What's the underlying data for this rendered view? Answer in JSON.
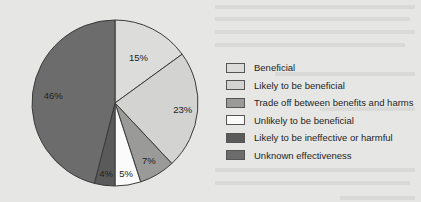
{
  "chart_data": {
    "type": "pie",
    "title": "",
    "categories": [
      "Beneficial",
      "Likely to be beneficial",
      "Trade off between benefits and harms",
      "Unlikely to be beneficial",
      "Likely to be ineffective or harmful",
      "Unknown effectiveness"
    ],
    "values": [
      15,
      23,
      7,
      5,
      4,
      46
    ],
    "value_labels": [
      "15%",
      "23%",
      "7%",
      "5%",
      "4%",
      "46%"
    ],
    "units": "%",
    "start_angle_deg": 0,
    "direction": "clockwise",
    "legend_position": "right",
    "mapping_note": "Slice values were read directly from the pie. The assignment of each value to a category is inferred from swatch shade and legend order, not read from labels: 15%/23% (both light) and 4%/46% (both dark) cannot be told apart by shade alone, so these pairings may be swapped.",
    "colors": [
      "#dcdcda",
      "#d3d3d1",
      "#9a9a98",
      "#fbfbfb",
      "#5a5a5a",
      "#6c6c6c"
    ]
  },
  "legend": {
    "items": [
      {
        "label": "Beneficial",
        "color": "#dcdcda"
      },
      {
        "label": "Likely to be beneficial",
        "color": "#d3d3d1"
      },
      {
        "label": "Trade off between benefits and harms",
        "color": "#9a9a98"
      },
      {
        "label": "Unlikely to be beneficial",
        "color": "#fbfbfb"
      },
      {
        "label": "Likely to be ineffective or harmful",
        "color": "#5a5a5a"
      },
      {
        "label": "Unknown effectiveness",
        "color": "#6c6c6c"
      }
    ]
  },
  "slices": [
    {
      "label": "15%"
    },
    {
      "label": "23%"
    },
    {
      "label": "7%"
    },
    {
      "label": "5%"
    },
    {
      "label": "4%"
    },
    {
      "label": "46%"
    }
  ]
}
